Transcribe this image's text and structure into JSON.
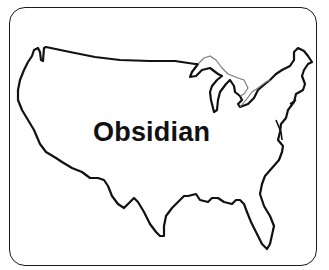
{
  "map": {
    "region": "Contiguous United States",
    "label": "Obsidian",
    "outline_color": "#111111",
    "lakes_color": "#777777",
    "background": "#ffffff"
  }
}
